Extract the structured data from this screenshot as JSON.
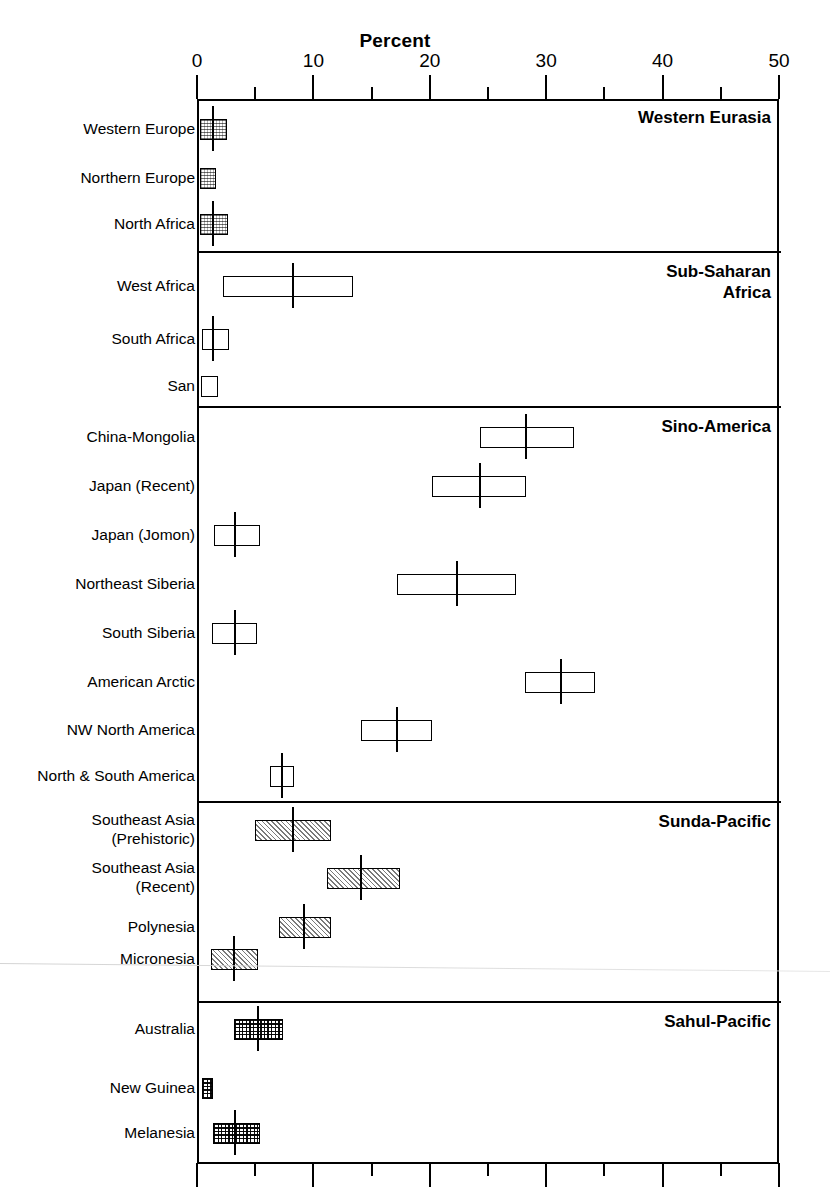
{
  "chart_data": {
    "type": "bar",
    "title": "Percent",
    "xlabel": "Percent",
    "ylabel": "",
    "xlim": [
      0,
      50
    ],
    "xticks": [
      0,
      10,
      20,
      30,
      40,
      50
    ],
    "xtick_labels": [
      "0",
      "10",
      "20",
      "30",
      "40",
      "50"
    ],
    "minor_tick_step": 5,
    "grid": false,
    "legend": "none",
    "note": "Horizontal box/whisker style markers: each row shows a range box with a central median tick, grouped into five labelled panels.",
    "panels": [
      {
        "title": "Western Eurasia",
        "fill": "stipple",
        "rows": [
          {
            "label": "Western Europe",
            "low": 0.1,
            "high": 2.4,
            "median": 1.2
          },
          {
            "label": "Northern Europe",
            "low": 0.1,
            "high": 1.5,
            "median": null
          },
          {
            "label": "North Africa",
            "low": 0.1,
            "high": 2.5,
            "median": 1.2
          }
        ]
      },
      {
        "title": "Sub-Saharan\nAfrica",
        "fill": "none",
        "rows": [
          {
            "label": "West Africa",
            "low": 2.1,
            "high": 13.2,
            "median": 8.1
          },
          {
            "label": "South Africa",
            "low": 0.3,
            "high": 2.6,
            "median": 1.2
          },
          {
            "label": "San",
            "low": 0.2,
            "high": 1.6,
            "median": null
          }
        ]
      },
      {
        "title": "Sino-America",
        "fill": "none",
        "rows": [
          {
            "label": "China-Mongolia",
            "low": 24.1,
            "high": 32.2,
            "median": 28.1
          },
          {
            "label": "Japan (Recent)",
            "low": 20.0,
            "high": 28.1,
            "median": 24.1
          },
          {
            "label": "Japan (Jomon)",
            "low": 1.3,
            "high": 5.2,
            "median": 3.1
          },
          {
            "label": "Northeast Siberia",
            "low": 17.0,
            "high": 27.2,
            "median": 22.2
          },
          {
            "label": "South Siberia",
            "low": 1.1,
            "high": 5.0,
            "median": 3.1
          },
          {
            "label": "American Arctic",
            "low": 28.0,
            "high": 34.0,
            "median": 31.1
          },
          {
            "label": "NW North America",
            "low": 13.9,
            "high": 20.0,
            "median": 17.0
          },
          {
            "label": "North & South America",
            "low": 6.1,
            "high": 8.2,
            "median": 7.1
          }
        ]
      },
      {
        "title": "Sunda-Pacific",
        "fill": "diagonal",
        "rows": [
          {
            "label": "Southeast Asia\n(Prehistoric)",
            "low": 4.8,
            "high": 11.3,
            "median": 8.1
          },
          {
            "label": "Southeast Asia\n(Recent)",
            "low": 11.0,
            "high": 17.3,
            "median": 13.9
          },
          {
            "label": "Polynesia",
            "low": 6.9,
            "high": 11.3,
            "median": 9.0
          },
          {
            "label": "Micronesia",
            "low": 1.0,
            "high": 5.1,
            "median": 3.0
          }
        ]
      },
      {
        "title": "Sahul-Pacific",
        "fill": "crosshatch",
        "rows": [
          {
            "label": "Australia",
            "low": 3.0,
            "high": 7.2,
            "median": 5.1
          },
          {
            "label": "New Guinea",
            "low": 0.3,
            "high": 1.2,
            "median": null
          },
          {
            "label": "Melanesia",
            "low": 1.2,
            "high": 5.2,
            "median": 3.1
          }
        ]
      }
    ]
  },
  "colors": {
    "ink": "#000000",
    "background": "#ffffff"
  }
}
